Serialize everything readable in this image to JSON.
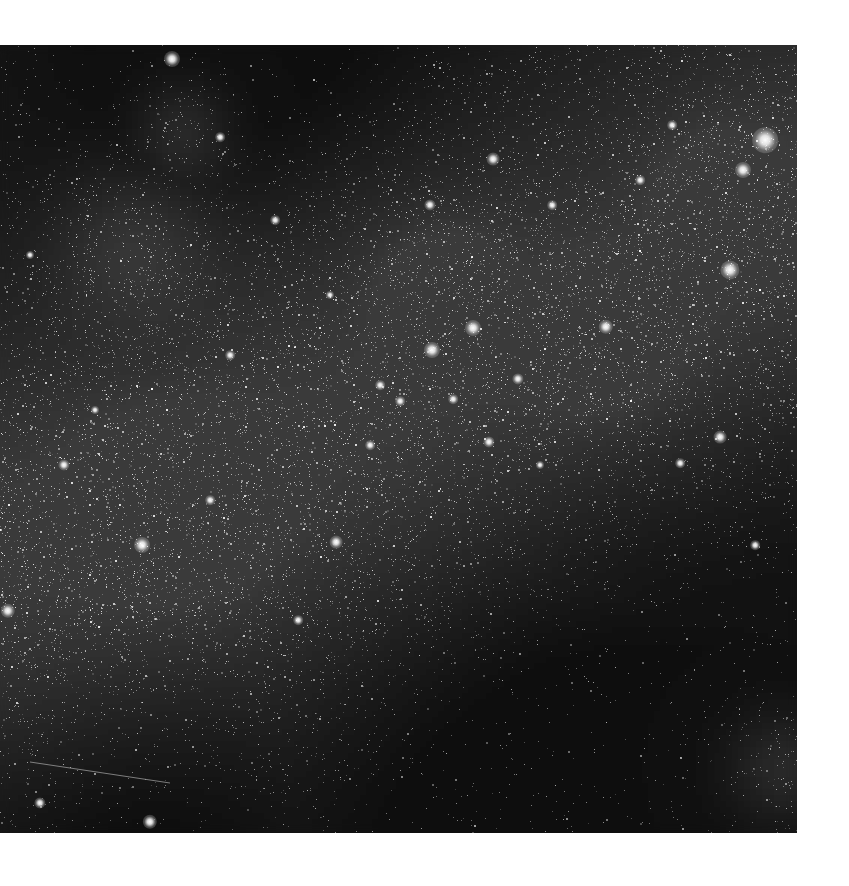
{
  "image": {
    "subject": "star field",
    "frame": {
      "left": 0,
      "top": 45,
      "width": 797,
      "height": 788
    },
    "page_background": "#ffffff",
    "sky_color": "#050505",
    "haze_color": "#9a9a9a",
    "star_color": "#ffffff",
    "haze_band": {
      "description": "diagonal brighter stellar band from lower-left to upper-right",
      "points": [
        [
          0,
          500
        ],
        [
          200,
          450
        ],
        [
          420,
          330
        ],
        [
          620,
          260
        ],
        [
          797,
          170
        ]
      ],
      "width": 330
    },
    "dark_regions": [
      {
        "x": 650,
        "y": 420,
        "r": 220
      },
      {
        "x": 560,
        "y": 700,
        "r": 260
      },
      {
        "x": 260,
        "y": 40,
        "r": 180
      },
      {
        "x": 120,
        "y": 760,
        "r": 160
      }
    ],
    "clusters": [
      {
        "x": 180,
        "y": 85,
        "r": 35
      },
      {
        "x": 130,
        "y": 195,
        "r": 55
      },
      {
        "x": 720,
        "y": 145,
        "r": 40
      },
      {
        "x": 600,
        "y": 290,
        "r": 45
      },
      {
        "x": 170,
        "y": 455,
        "r": 60
      },
      {
        "x": 440,
        "y": 240,
        "r": 40
      },
      {
        "x": 780,
        "y": 720,
        "r": 40
      }
    ],
    "bright_stars": [
      {
        "x": 765,
        "y": 95,
        "size": 16
      },
      {
        "x": 743,
        "y": 125,
        "size": 10
      },
      {
        "x": 730,
        "y": 225,
        "size": 12
      },
      {
        "x": 172,
        "y": 14,
        "size": 10
      },
      {
        "x": 493,
        "y": 114,
        "size": 8
      },
      {
        "x": 430,
        "y": 160,
        "size": 7
      },
      {
        "x": 473,
        "y": 283,
        "size": 10
      },
      {
        "x": 432,
        "y": 305,
        "size": 10
      },
      {
        "x": 606,
        "y": 282,
        "size": 9
      },
      {
        "x": 518,
        "y": 334,
        "size": 7
      },
      {
        "x": 489,
        "y": 397,
        "size": 7
      },
      {
        "x": 142,
        "y": 500,
        "size": 10
      },
      {
        "x": 336,
        "y": 497,
        "size": 8
      },
      {
        "x": 720,
        "y": 392,
        "size": 8
      },
      {
        "x": 64,
        "y": 420,
        "size": 7
      },
      {
        "x": 8,
        "y": 566,
        "size": 9
      },
      {
        "x": 150,
        "y": 777,
        "size": 9
      },
      {
        "x": 40,
        "y": 758,
        "size": 7
      },
      {
        "x": 220,
        "y": 92,
        "size": 6
      },
      {
        "x": 552,
        "y": 160,
        "size": 6
      },
      {
        "x": 640,
        "y": 135,
        "size": 6
      },
      {
        "x": 672,
        "y": 80,
        "size": 6
      },
      {
        "x": 380,
        "y": 340,
        "size": 6
      },
      {
        "x": 400,
        "y": 356,
        "size": 6
      },
      {
        "x": 453,
        "y": 354,
        "size": 6
      },
      {
        "x": 370,
        "y": 400,
        "size": 6
      },
      {
        "x": 230,
        "y": 310,
        "size": 6
      },
      {
        "x": 275,
        "y": 175,
        "size": 6
      },
      {
        "x": 210,
        "y": 455,
        "size": 6
      },
      {
        "x": 680,
        "y": 418,
        "size": 6
      },
      {
        "x": 755,
        "y": 500,
        "size": 6
      },
      {
        "x": 298,
        "y": 575,
        "size": 6
      },
      {
        "x": 95,
        "y": 365,
        "size": 5
      },
      {
        "x": 30,
        "y": 210,
        "size": 5
      },
      {
        "x": 330,
        "y": 250,
        "size": 5
      },
      {
        "x": 540,
        "y": 420,
        "size": 5
      }
    ],
    "streak": {
      "x1": 30,
      "y1": 762,
      "x2": 170,
      "y2": 783
    },
    "noise_star_count": 26000,
    "random_seed": 1337
  }
}
